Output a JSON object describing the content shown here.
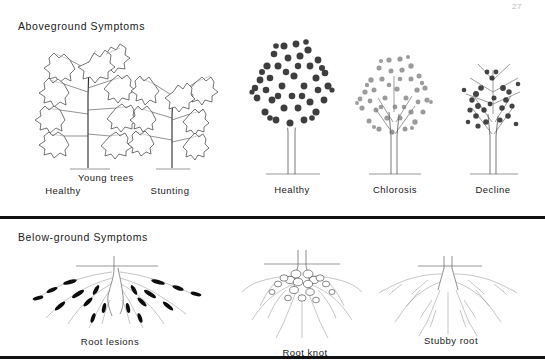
{
  "page_number": "27",
  "panels": [
    {
      "id": "aboveground",
      "heading": "Aboveground Symptoms",
      "groups": [
        {
          "id": "young-trees",
          "group_label": "Young trees",
          "items": [
            {
              "id": "young-healthy",
              "label": "Healthy"
            },
            {
              "id": "young-stunting",
              "label": "Stunting"
            }
          ]
        },
        {
          "id": "mature-trees",
          "group_label": "",
          "items": [
            {
              "id": "mature-healthy",
              "label": "Healthy"
            },
            {
              "id": "mature-chlorosis",
              "label": "Chlorosis"
            },
            {
              "id": "mature-decline",
              "label": "Decline"
            }
          ]
        }
      ]
    },
    {
      "id": "belowground",
      "heading": "Below-ground Symptoms",
      "groups": [
        {
          "id": "root-symptoms",
          "group_label": "",
          "items": [
            {
              "id": "root-lesions",
              "label": "Root  lesions"
            },
            {
              "id": "root-knot",
              "label": "Root knot"
            },
            {
              "id": "stubby-root",
              "label": "Stubby root"
            }
          ]
        }
      ]
    }
  ],
  "colors": {
    "ink": "#1a1a1a",
    "rule": "#111111",
    "lesion": "#0d0d0d",
    "background": "#ffffff"
  }
}
